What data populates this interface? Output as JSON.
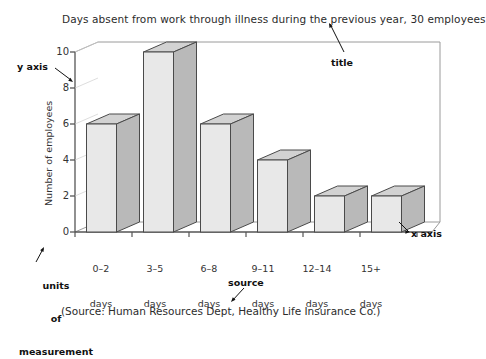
{
  "chart_data": {
    "type": "bar",
    "title": "Days absent from work through illness during the previous year, 30 employees",
    "xlabel": "",
    "ylabel": "Number of employees",
    "categories": [
      "0–2\ndays",
      "3–5\ndays",
      "6–8\ndays",
      "9–11\ndays",
      "12–14\ndays",
      "15+\ndays"
    ],
    "category_ranges": [
      "0–2",
      "3–5",
      "6–8",
      "9–11",
      "12–14",
      "15+"
    ],
    "category_units": [
      "days",
      "days",
      "days",
      "days",
      "days",
      "days"
    ],
    "values": [
      6,
      10,
      6,
      4,
      2,
      2
    ],
    "ylim": [
      0,
      10
    ],
    "yticks": [
      0,
      2,
      4,
      6,
      8,
      10
    ],
    "ytick_labels": [
      "0",
      "2",
      "4",
      "6",
      "8",
      "10"
    ],
    "grid": false,
    "legend": false,
    "style": "3d-column",
    "source": "(Source: Human Resources Dept, Healthy Life Insurance Co.)"
  },
  "annotations": {
    "y_axis": "y axis",
    "x_axis": "x axis",
    "title_pointer": "title",
    "units_line1": "units",
    "units_line2": "of",
    "units_line3": "measurement",
    "source_pointer": "source"
  },
  "colors": {
    "bar_front": "#e8e8e8",
    "bar_side": "#b9b9b9",
    "bar_top": "#d2d2d2",
    "bar_stroke": "#4a4a4a",
    "axis": "#555555",
    "wall": "#9a9a9a",
    "text": "#2b2b2b"
  }
}
